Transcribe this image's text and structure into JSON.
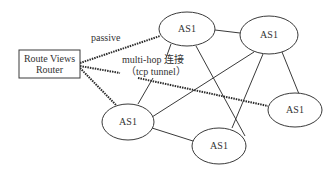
{
  "diagram": {
    "router": {
      "line1": "Route Views",
      "line2": "Router"
    },
    "nodes": [
      {
        "id": "as-top-center",
        "label": "AS1"
      },
      {
        "id": "as-top-right",
        "label": "AS1"
      },
      {
        "id": "as-right",
        "label": "AS1"
      },
      {
        "id": "as-bottom-left",
        "label": "AS1"
      },
      {
        "id": "as-bottom-center",
        "label": "AS1"
      }
    ],
    "labels": {
      "passive": "passive",
      "multihop_line1": "multi-hop 连接",
      "multihop_line2": "（tcp tunnel）"
    },
    "colors": {
      "stroke": "#3a3a3a",
      "dashed": "#2a2a2a",
      "text": "#333333"
    }
  }
}
